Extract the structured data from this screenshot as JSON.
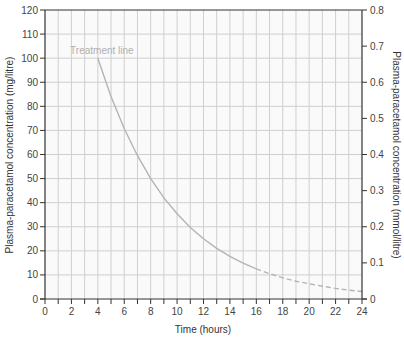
{
  "chart_data": {
    "type": "line",
    "title": "",
    "xlabel": "Time (hours)",
    "ylabel": "Plasma-paracetamol concentration (mg/litre)",
    "ylabel_right": "Plasma-paracetamol concentration (mmol/litre)",
    "xlim": [
      0,
      24
    ],
    "ylim": [
      0,
      120
    ],
    "ylim_right": [
      0,
      0.8
    ],
    "grid": true,
    "x_ticks": [
      0,
      2,
      4,
      6,
      8,
      10,
      12,
      14,
      16,
      18,
      20,
      22,
      24
    ],
    "y_ticks": [
      0,
      10,
      20,
      30,
      40,
      50,
      60,
      70,
      80,
      90,
      100,
      110,
      120
    ],
    "y_ticks_right": [
      "0",
      "0.1",
      "0.2",
      "0.3",
      "0.4",
      "0.5",
      "0.6",
      "0.7",
      "0.8"
    ],
    "annotations": [
      {
        "text": "Treatment line",
        "x": 1.9,
        "y": 103
      }
    ],
    "series": [
      {
        "name": "Treatment line",
        "style": "solid",
        "x": [
          4,
          5,
          6,
          7,
          8,
          9,
          10,
          11,
          12,
          13,
          14,
          15,
          16
        ],
        "values": [
          100,
          84.1,
          70.7,
          59.5,
          50,
          42,
          35.4,
          29.7,
          25,
          21,
          17.7,
          14.9,
          12.5
        ]
      },
      {
        "name": "Treatment line (extrapolated)",
        "style": "dashed",
        "x": [
          16,
          17,
          18,
          19,
          20,
          21,
          22,
          23,
          24
        ],
        "values": [
          12.5,
          10.5,
          8.8,
          7.4,
          6.3,
          5.3,
          4.4,
          3.7,
          3.1
        ]
      }
    ],
    "colors": {
      "curve": "#b4b4b4",
      "grid": "#cfcfcf",
      "axis": "#333333",
      "plot_bg": "#fafafa"
    }
  }
}
